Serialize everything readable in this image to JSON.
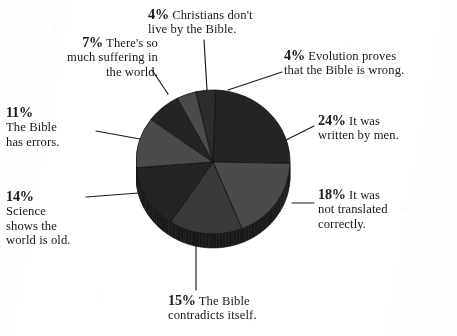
{
  "chart_data": {
    "type": "pie",
    "title": "",
    "subtitle": "",
    "xlabel": "",
    "ylabel": "",
    "legend_position": "callout-labels",
    "grid": false,
    "units": "percent",
    "total": 97,
    "categories": [
      "It was written by men.",
      "It was not translated correctly.",
      "The Bible contradicts itself.",
      "Science shows the world is old.",
      "The Bible has errors.",
      "There's so much suffering in the world.",
      "Christians don't live by the Bible.",
      "Evolution proves that the Bible is wrong."
    ],
    "values": [
      24,
      18,
      15,
      14,
      11,
      7,
      4,
      4
    ],
    "slice_colors": [
      "#262628",
      "#4c4c4e",
      "#3a3a3c",
      "#262628",
      "#4c4c4e",
      "#262628",
      "#4c4c4e",
      "#2e2e30"
    ]
  },
  "chart": {
    "center_x": 77,
    "center_y": 76,
    "radius_x": 77,
    "radius_y": 72,
    "depth": 14,
    "side_color": "#1c1c1e",
    "outline_color": "#111111",
    "start_angle_deg": -88
  },
  "labels": {
    "christians": {
      "pct": "4%",
      "line1": "Christians don't",
      "line2": "live by the Bible."
    },
    "evolution": {
      "pct": "4%",
      "line1": "Evolution proves",
      "line2": "that the Bible is wrong."
    },
    "written_by_men": {
      "pct": "24%",
      "line1": "It was",
      "line2": "written by men."
    },
    "not_translated": {
      "pct": "18%",
      "line1": "It was",
      "line2": "not translated",
      "line3": "correctly."
    },
    "contradicts": {
      "pct": "15%",
      "line1": "The Bible",
      "line2": "contradicts itself."
    },
    "science": {
      "pct": "14%",
      "line1": "Science",
      "line2": "shows the",
      "line3": "world is old."
    },
    "errors": {
      "pct": "11%",
      "line1": "The Bible",
      "line2": "has errors."
    },
    "suffering": {
      "pct": "7%",
      "line1": "There's so",
      "line2": "much suffering in",
      "line3": "the world."
    }
  },
  "style": {
    "background": "#fefefe",
    "text_color": "#1a1a1a",
    "leader_color": "#1a1a1a"
  }
}
